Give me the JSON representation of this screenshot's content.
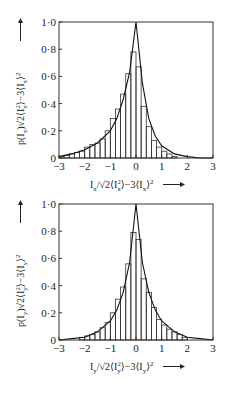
{
  "chart_data": [
    {
      "type": "bar",
      "title": "",
      "xlabel": "I_x/√2⟨I_x²⟩−3⟨I_x⟩² →",
      "ylabel": "p(I_x)√2⟨I_x²⟩−3⟨I_x⟩² →",
      "xlim": [
        -3,
        3
      ],
      "ylim": [
        0,
        1.0
      ],
      "xticks": [
        "−3",
        "−2",
        "−1",
        "0",
        "1",
        "2",
        "3"
      ],
      "yticks": [
        "0",
        "0·2",
        "0·4",
        "0·6",
        "0·8",
        "1·0"
      ],
      "grid": false,
      "bin_width": 0.2,
      "categories": [
        -2.9,
        -2.7,
        -2.5,
        -2.3,
        -2.1,
        -1.9,
        -1.7,
        -1.5,
        -1.3,
        -1.1,
        -0.9,
        -0.7,
        -0.5,
        -0.3,
        -0.1,
        0.1,
        0.3,
        0.5,
        0.7,
        0.9,
        1.1,
        1.3,
        1.5,
        1.7,
        1.9,
        2.1,
        2.3,
        2.5,
        2.7,
        2.9
      ],
      "series": [
        {
          "name": "histogram",
          "values": [
            0.01,
            0.02,
            0.03,
            0.04,
            0.05,
            0.08,
            0.1,
            0.11,
            0.14,
            0.2,
            0.29,
            0.36,
            0.47,
            0.62,
            0.78,
            0.67,
            0.38,
            0.23,
            0.13,
            0.08,
            0.05,
            0.03,
            0.01,
            0.0,
            0.0,
            0.0,
            0.0,
            0.0,
            0.0,
            0.0
          ]
        },
        {
          "name": "fitted curve (cusp at 0, peak 1.0)",
          "x": [
            -3,
            -2.5,
            -2,
            -1.5,
            -1,
            -0.75,
            -0.5,
            -0.25,
            0,
            0.25,
            0.5,
            0.75,
            1,
            1.5,
            2,
            2.5,
            3
          ],
          "values": [
            0.01,
            0.03,
            0.06,
            0.11,
            0.2,
            0.29,
            0.43,
            0.63,
            1.0,
            0.55,
            0.29,
            0.16,
            0.09,
            0.03,
            0.01,
            0.0,
            0.0
          ]
        }
      ]
    },
    {
      "type": "bar",
      "title": "",
      "xlabel": "I_y/√2⟨I_y²⟩−3⟨I_y⟩² →",
      "ylabel": "p(I_y)√2⟨I_y²⟩−3⟨I_y⟩² →",
      "xlim": [
        -3,
        3
      ],
      "ylim": [
        0,
        1.0
      ],
      "xticks": [
        "−3",
        "−2",
        "−1",
        "0",
        "1",
        "2",
        "3"
      ],
      "yticks": [
        "0",
        "0·2",
        "0·4",
        "0·6",
        "0·8",
        "1·0"
      ],
      "grid": false,
      "bin_width": 0.2,
      "categories": [
        -2.9,
        -2.7,
        -2.5,
        -2.3,
        -2.1,
        -1.9,
        -1.7,
        -1.5,
        -1.3,
        -1.1,
        -0.9,
        -0.7,
        -0.5,
        -0.3,
        -0.1,
        0.1,
        0.3,
        0.5,
        0.7,
        0.9,
        1.1,
        1.3,
        1.5,
        1.7,
        1.9,
        2.1,
        2.3,
        2.5,
        2.7,
        2.9
      ],
      "series": [
        {
          "name": "histogram",
          "values": [
            0.0,
            0.0,
            0.0,
            0.0,
            0.02,
            0.03,
            0.04,
            0.06,
            0.09,
            0.13,
            0.2,
            0.3,
            0.39,
            0.56,
            0.79,
            0.74,
            0.45,
            0.35,
            0.24,
            0.15,
            0.11,
            0.08,
            0.06,
            0.04,
            0.02,
            0.0,
            0.0,
            0.0,
            0.0,
            0.0
          ]
        },
        {
          "name": "fitted curve (symmetric cusp at 0, peak 1.0)",
          "x": [
            -3,
            -2.5,
            -2,
            -1.5,
            -1,
            -0.75,
            -0.5,
            -0.25,
            0,
            0.25,
            0.5,
            0.75,
            1,
            1.5,
            2,
            2.5,
            3
          ],
          "values": [
            0.0,
            0.01,
            0.02,
            0.06,
            0.14,
            0.22,
            0.35,
            0.57,
            1.0,
            0.57,
            0.35,
            0.22,
            0.14,
            0.06,
            0.02,
            0.01,
            0.0
          ]
        }
      ]
    }
  ],
  "charts": [
    {
      "ylabel_main": "p(I",
      "sub": "x",
      "xticks": [
        "−3",
        "−2",
        "−1",
        "0",
        "1",
        "2",
        "3"
      ],
      "yticks": [
        "0",
        "0·2",
        "0·4",
        "0·6",
        "0·8",
        "1·0"
      ]
    },
    {
      "ylabel_main": "p(I",
      "sub": "y",
      "xticks": [
        "−3",
        "−2",
        "−1",
        "0",
        "1",
        "2",
        "3"
      ],
      "yticks": [
        "0",
        "0·2",
        "0·4",
        "0·6",
        "0·8",
        "1·0"
      ]
    }
  ],
  "caption_stub": "Fig. ..."
}
